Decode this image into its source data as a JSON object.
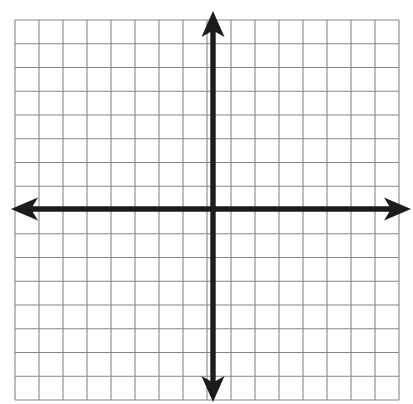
{
  "page": {
    "background_color": "#ffffff",
    "width": 413,
    "height": 404
  },
  "artifact": {
    "top_margin_text": "x, y",
    "note": "faint cut-off handwriting remnant at top edge"
  },
  "chart_data": {
    "type": "scatter",
    "title": "",
    "subtitle": "",
    "xlabel": "",
    "ylabel": "",
    "x": [],
    "y": [],
    "series": [],
    "annotations": [],
    "legend": {
      "entries": [],
      "position": "none"
    },
    "tick_labels": {
      "x": [],
      "y": []
    },
    "xlim": [
      -8,
      8
    ],
    "ylim": [
      -8,
      8
    ],
    "grid": {
      "visible": true,
      "columns": 16,
      "rows": 16,
      "cells_left_of_origin": 8,
      "cells_right_of_origin": 8,
      "cells_above_origin": 8,
      "cells_below_origin": 8,
      "line_color": "#808080",
      "line_width": 1,
      "cell_width": 24,
      "cell_height": 23.75
    },
    "axes": {
      "color": "#1a1a1a",
      "line_width": 5,
      "origin_x": 213,
      "origin_y": 209,
      "arrowheads": [
        "up",
        "down",
        "left",
        "right"
      ],
      "x_axis_start": 12,
      "x_axis_end": 410,
      "y_axis_top": 12,
      "y_axis_bottom": 400,
      "show_tick_labels": false,
      "show_axis_labels": false
    },
    "plot_area": {
      "left": 15,
      "top": 20,
      "right": 399,
      "bottom": 400
    }
  }
}
